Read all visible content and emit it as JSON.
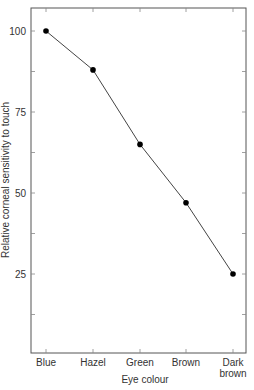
{
  "chart_data": {
    "type": "line",
    "title": "",
    "xlabel": "Eye colour",
    "ylabel": "Relative corneal sensitivity to touch",
    "categories": [
      "Blue",
      "Hazel",
      "Green",
      "Brown",
      "Dark brown"
    ],
    "values": [
      100,
      88,
      65,
      47,
      25
    ],
    "ylim": [
      0,
      107
    ],
    "yticks": [
      25,
      50,
      75,
      100
    ],
    "grid": false,
    "legend": "none",
    "markers": "filled-circle"
  },
  "labels": {
    "xlabel": "Eye colour",
    "ylabel": "Relative corneal sensitivity to touch",
    "yticks": [
      "25",
      "50",
      "75",
      "100"
    ],
    "categories": [
      "Blue",
      "Hazel",
      "Green",
      "Brown",
      "Dark",
      "brown"
    ]
  },
  "colors": {
    "line": "#444444",
    "marker": "#000000",
    "axis": "#555555"
  }
}
